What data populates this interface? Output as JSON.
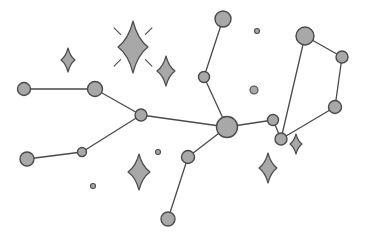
{
  "figure": {
    "type": "star-constellation-diagram",
    "width": 365,
    "height": 239,
    "background_color": "#ffffff"
  },
  "style": {
    "node_fill": "#a8a8a8",
    "node_stroke": "#4a4a4a",
    "node_stroke_width": 1.4,
    "edge_color": "#4a4a4a",
    "edge_width": 1.3,
    "sparkle_fill": "#a8a8a8",
    "sparkle_stroke": "#4a4a4a",
    "sparkle_stroke_width": 1.2,
    "ray_color": "#4a4a4a",
    "ray_width": 1.1
  },
  "nodes": [
    {
      "id": "n1",
      "label": "star-node-west-upper-left",
      "x": 24,
      "y": 89,
      "r": 6.5
    },
    {
      "id": "n2",
      "label": "star-node-west-upper-right",
      "x": 95,
      "y": 89,
      "r": 7.5
    },
    {
      "id": "n3",
      "label": "star-node-west-junction",
      "x": 141,
      "y": 115,
      "r": 6.0
    },
    {
      "id": "n4",
      "label": "star-node-southwest-outer",
      "x": 27,
      "y": 159,
      "r": 7.0
    },
    {
      "id": "n5",
      "label": "star-node-southwest-mid",
      "x": 82,
      "y": 152,
      "r": 4.5
    },
    {
      "id": "n6",
      "label": "star-node-hub",
      "x": 227,
      "y": 127,
      "r": 10.5
    },
    {
      "id": "n7",
      "label": "star-node-north-tip",
      "x": 223,
      "y": 19,
      "r": 8.0
    },
    {
      "id": "n8",
      "label": "star-node-north-mid",
      "x": 204,
      "y": 77,
      "r": 5.5
    },
    {
      "id": "n9",
      "label": "star-node-south-mid",
      "x": 188,
      "y": 157,
      "r": 6.5
    },
    {
      "id": "n10",
      "label": "star-node-south-tip",
      "x": 168,
      "y": 219,
      "r": 7.0
    },
    {
      "id": "n11",
      "label": "star-node-east-link",
      "x": 273,
      "y": 120,
      "r": 5.5
    },
    {
      "id": "n12",
      "label": "star-node-polygon-bottom-left",
      "x": 281,
      "y": 139,
      "r": 6.0
    },
    {
      "id": "n13",
      "label": "star-node-polygon-top",
      "x": 305,
      "y": 36,
      "r": 9.0
    },
    {
      "id": "n14",
      "label": "star-node-polygon-right",
      "x": 342,
      "y": 57,
      "r": 6.0
    },
    {
      "id": "n15",
      "label": "star-node-polygon-bottom-right",
      "x": 335,
      "y": 107,
      "r": 6.5
    }
  ],
  "edges": [
    {
      "from": "n1",
      "to": "n2",
      "label": "edge-west-top"
    },
    {
      "from": "n2",
      "to": "n3",
      "label": "edge-west-down"
    },
    {
      "from": "n3",
      "to": "n6",
      "label": "edge-junction-hub"
    },
    {
      "from": "n4",
      "to": "n5",
      "label": "edge-southwest-outer"
    },
    {
      "from": "n5",
      "to": "n3",
      "label": "edge-southwest-junction"
    },
    {
      "from": "n7",
      "to": "n8",
      "label": "edge-north-upper"
    },
    {
      "from": "n8",
      "to": "n6",
      "label": "edge-north-lower"
    },
    {
      "from": "n6",
      "to": "n9",
      "label": "edge-south-upper"
    },
    {
      "from": "n9",
      "to": "n10",
      "label": "edge-south-lower"
    },
    {
      "from": "n6",
      "to": "n11",
      "label": "edge-hub-east"
    },
    {
      "from": "n11",
      "to": "n12",
      "label": "edge-east-polygon"
    },
    {
      "from": "n12",
      "to": "n13",
      "label": "edge-polygon-left"
    },
    {
      "from": "n13",
      "to": "n14",
      "label": "edge-polygon-top"
    },
    {
      "from": "n14",
      "to": "n15",
      "label": "edge-polygon-right"
    },
    {
      "from": "n15",
      "to": "n12",
      "label": "edge-polygon-bottom"
    }
  ],
  "sparkles": [
    {
      "label": "sparkle-large-rayed",
      "x": 133,
      "y": 47,
      "rx": 15,
      "ry": 26,
      "rays": true
    },
    {
      "label": "sparkle-small-left",
      "x": 68,
      "y": 60,
      "rx": 7,
      "ry": 12,
      "rays": false
    },
    {
      "label": "sparkle-mid-upper",
      "x": 166,
      "y": 71,
      "rx": 9,
      "ry": 15,
      "rays": false
    },
    {
      "label": "sparkle-mid-lower",
      "x": 139,
      "y": 172,
      "rx": 11,
      "ry": 18,
      "rays": false
    },
    {
      "label": "sparkle-small-right",
      "x": 296,
      "y": 144,
      "rx": 6,
      "ry": 10,
      "rays": false
    },
    {
      "label": "sparkle-lower-right",
      "x": 268,
      "y": 168,
      "rx": 9,
      "ry": 15,
      "rays": false
    }
  ],
  "dots": [
    {
      "label": "dot-tiny-north",
      "x": 257,
      "y": 31,
      "r": 2.5
    },
    {
      "label": "dot-small-center",
      "x": 254,
      "y": 90,
      "r": 4.0
    },
    {
      "label": "dot-tiny-midleft",
      "x": 158,
      "y": 152,
      "r": 2.5
    },
    {
      "label": "dot-tiny-southwest",
      "x": 93,
      "y": 186,
      "r": 2.5
    }
  ]
}
